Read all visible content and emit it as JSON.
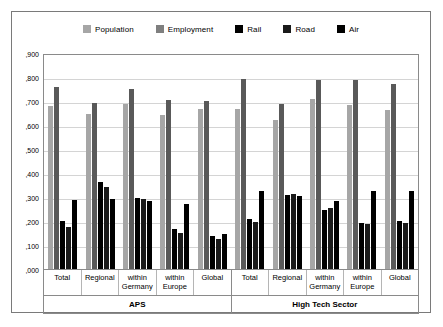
{
  "chart_data": {
    "type": "bar",
    "title": "",
    "xlabel": "",
    "ylabel": "",
    "ylim": [
      0.0,
      0.9
    ],
    "grid": true,
    "legend_position": "top-center",
    "ytick_labels": [
      ",900",
      ",800",
      ",700",
      ",600",
      ",500",
      ",400",
      ",300",
      ",200",
      ",100",
      ",000"
    ],
    "ytick_values": [
      0.9,
      0.8,
      0.7,
      0.6,
      0.5,
      0.4,
      0.3,
      0.2,
      0.1,
      0.0
    ],
    "supergroups": [
      {
        "label": "APS",
        "span": 5
      },
      {
        "label": "High Tech Sector",
        "span": 5
      }
    ],
    "categories": [
      "Total",
      "Regional",
      "within Germany",
      "within Europe",
      "Global",
      "Total",
      "Regional",
      "within Germany",
      "within Europe",
      "Global"
    ],
    "category_lines": [
      [
        "Total"
      ],
      [
        "Regional"
      ],
      [
        "within",
        "Germany"
      ],
      [
        "within",
        "Europe"
      ],
      [
        "Global"
      ],
      [
        "Total"
      ],
      [
        "Regional"
      ],
      [
        "within",
        "Germany"
      ],
      [
        "within",
        "Europe"
      ],
      [
        "Global"
      ]
    ],
    "series": [
      {
        "name": "Population",
        "color": "#a6a6a6",
        "values": [
          0.685,
          0.65,
          0.695,
          0.648,
          0.672,
          0.672,
          0.628,
          0.715,
          0.69,
          0.67
        ]
      },
      {
        "name": "Employment",
        "color": "#595959",
        "values": [
          0.765,
          0.7,
          0.758,
          0.712,
          0.705,
          0.8,
          0.692,
          0.795,
          0.793,
          0.78
        ]
      },
      {
        "name": "Rail",
        "color": "#000000",
        "values": [
          0.2,
          0.365,
          0.3,
          0.168,
          0.138,
          0.212,
          0.31,
          0.248,
          0.195,
          0.2
        ]
      },
      {
        "name": "Road",
        "color": "#1a1a1a",
        "values": [
          0.178,
          0.345,
          0.295,
          0.15,
          0.128,
          0.198,
          0.315,
          0.255,
          0.188,
          0.195
        ]
      },
      {
        "name": "Air",
        "color": "#000000",
        "values": [
          0.29,
          0.295,
          0.288,
          0.272,
          0.148,
          0.33,
          0.305,
          0.285,
          0.33,
          0.328
        ]
      }
    ]
  },
  "legend": {
    "items": [
      {
        "label": "Population",
        "color": "#a6a6a6"
      },
      {
        "label": "Employment",
        "color": "#7f7f7f"
      },
      {
        "label": "Rail",
        "color": "#000000"
      },
      {
        "label": "Road",
        "color": "#1a1a1a"
      },
      {
        "label": "Air",
        "color": "#000000"
      }
    ]
  }
}
